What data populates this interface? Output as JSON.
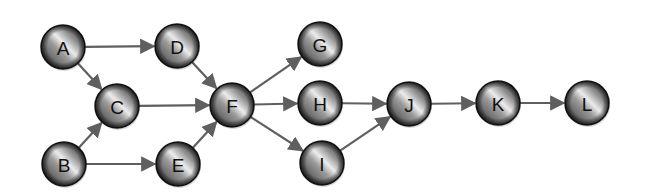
{
  "diagram": {
    "type": "directed-graph",
    "colors": {
      "background": "#ffffff",
      "edge": "#5f5f5f",
      "node_dark": "#2a2a2a",
      "node_mid": "#6e6e6e",
      "node_highlight": "#e8e8e8",
      "label": "#111111"
    },
    "node_radius": 22,
    "nodes": [
      {
        "id": "A",
        "label": "A",
        "x": 63,
        "y": 47
      },
      {
        "id": "B",
        "label": "B",
        "x": 64,
        "y": 164
      },
      {
        "id": "C",
        "label": "C",
        "x": 117,
        "y": 106
      },
      {
        "id": "D",
        "label": "D",
        "x": 177,
        "y": 46
      },
      {
        "id": "E",
        "label": "E",
        "x": 178,
        "y": 164
      },
      {
        "id": "F",
        "label": "F",
        "x": 232,
        "y": 105
      },
      {
        "id": "G",
        "label": "G",
        "x": 320,
        "y": 44
      },
      {
        "id": "H",
        "label": "H",
        "x": 320,
        "y": 103
      },
      {
        "id": "I",
        "label": "I",
        "x": 322,
        "y": 163
      },
      {
        "id": "J",
        "label": "J",
        "x": 409,
        "y": 104
      },
      {
        "id": "K",
        "label": "K",
        "x": 498,
        "y": 103
      },
      {
        "id": "L",
        "label": "L",
        "x": 587,
        "y": 103
      }
    ],
    "edges": [
      {
        "from": "A",
        "to": "D"
      },
      {
        "from": "A",
        "to": "C"
      },
      {
        "from": "B",
        "to": "C"
      },
      {
        "from": "B",
        "to": "E"
      },
      {
        "from": "C",
        "to": "F"
      },
      {
        "from": "D",
        "to": "F"
      },
      {
        "from": "E",
        "to": "F"
      },
      {
        "from": "F",
        "to": "G"
      },
      {
        "from": "F",
        "to": "H"
      },
      {
        "from": "F",
        "to": "I"
      },
      {
        "from": "H",
        "to": "J"
      },
      {
        "from": "I",
        "to": "J"
      },
      {
        "from": "J",
        "to": "K"
      },
      {
        "from": "K",
        "to": "L"
      }
    ]
  }
}
